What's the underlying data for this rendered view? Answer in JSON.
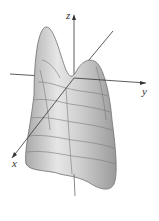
{
  "figure": {
    "type": "3d-surface",
    "axes": {
      "x_label": "x",
      "y_label": "y",
      "z_label": "z"
    },
    "colors": {
      "surface": "#d9d9d9",
      "surface_shade": "#a8a8a8",
      "contour": "#777777",
      "axis": "#333333"
    }
  }
}
